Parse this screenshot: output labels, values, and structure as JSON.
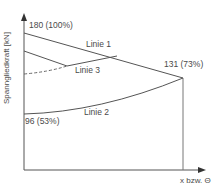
{
  "diagram": {
    "y_axis_label": "Spanngliedkraft [kN]",
    "x_axis_label": "x bzw. Θ",
    "annotations": {
      "start_value": "180 (100%)",
      "end_value": "131 (73%)",
      "min_value": "96 (53%)"
    },
    "lines": [
      {
        "name": "Linie 1",
        "style": "solid"
      },
      {
        "name": "Linie 2",
        "style": "solid"
      },
      {
        "name": "Linie 3",
        "style": "solid with dashed extension"
      }
    ],
    "colors": {
      "line": "#555555",
      "text": "#4a4a4a",
      "background": "#ffffff"
    }
  }
}
